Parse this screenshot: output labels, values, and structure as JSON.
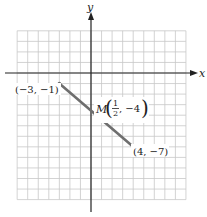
{
  "diagram": {
    "type": "coordinate-plane-segment",
    "axes": {
      "x_label": "x",
      "y_label": "y"
    },
    "grid": {
      "x_min": -7,
      "x_max": 9,
      "y_min": -12,
      "y_max": 4,
      "step": 1
    },
    "segment": {
      "start": {
        "x": -3,
        "y": -1,
        "label": "(−3, −1)"
      },
      "end": {
        "x": 4,
        "y": -7,
        "label": "(4, −7)"
      },
      "midpoint": {
        "x": 0.5,
        "y": -4,
        "name": "M",
        "frac_num": "1",
        "frac_den": "2",
        "y_text": ", −4"
      }
    },
    "colors": {
      "grid": "#c8c8c8",
      "axis": "#222222",
      "segment": "#6e6e6e",
      "text": "#222222"
    }
  }
}
